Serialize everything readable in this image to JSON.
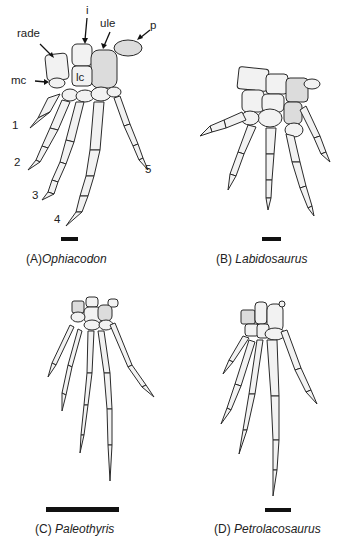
{
  "figure": {
    "background": "#ffffff",
    "panels": [
      {
        "id": "A",
        "prefix": "(A)",
        "species": "Ophiacodon",
        "anatomical_labels": [
          "rade",
          "i",
          "ule",
          "p",
          "mc",
          "lc"
        ],
        "digit_labels": [
          "1",
          "2",
          "3",
          "4",
          "5"
        ]
      },
      {
        "id": "B",
        "prefix": "(B) ",
        "species": "Labidosaurus"
      },
      {
        "id": "C",
        "prefix": "(C) ",
        "species": "Paleothyris"
      },
      {
        "id": "D",
        "prefix": "(D) ",
        "species": "Petrolacosaurus"
      }
    ]
  }
}
